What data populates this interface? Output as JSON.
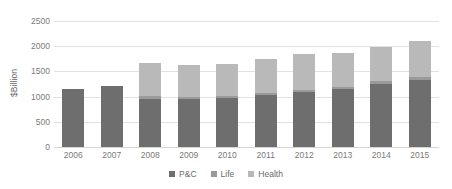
{
  "chart_data": {
    "type": "bar",
    "stacked": true,
    "title": "",
    "subtitle": "",
    "xlabel": "",
    "ylabel": "$Billion",
    "ylim": [
      0,
      2500
    ],
    "ytick_step": 500,
    "yticks": [
      0,
      500,
      1000,
      1500,
      2000,
      2500
    ],
    "ytick_labels": [
      "0",
      "500",
      "1000",
      "1500",
      "2000",
      "2500"
    ],
    "grid": true,
    "legend_position": "bottom",
    "categories": [
      "2006",
      "2007",
      "2008",
      "2009",
      "2010",
      "2011",
      "2012",
      "2013",
      "2014",
      "2015"
    ],
    "series": [
      {
        "name": "P&C",
        "color": "#6e6e6e",
        "values": [
          1150,
          1210,
          960,
          960,
          980,
          1030,
          1090,
          1150,
          1250,
          1320
        ]
      },
      {
        "name": "Life",
        "color": "#9a9a9a",
        "values": [
          0,
          0,
          60,
          40,
          40,
          50,
          50,
          50,
          60,
          60
        ]
      },
      {
        "name": "Health",
        "color": "#b9b9b9",
        "values": [
          0,
          0,
          650,
          620,
          620,
          660,
          700,
          660,
          670,
          730
        ]
      }
    ],
    "totals": [
      1150,
      1210,
      1670,
      1620,
      1640,
      1740,
      1840,
      1860,
      1980,
      2110
    ]
  },
  "legend": {
    "items": [
      {
        "label": "P&C",
        "color": "#6e6e6e"
      },
      {
        "label": "Life",
        "color": "#9a9a9a"
      },
      {
        "label": "Health",
        "color": "#b9b9b9"
      }
    ]
  }
}
